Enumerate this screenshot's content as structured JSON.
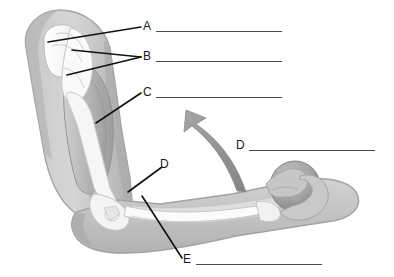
{
  "page": {
    "kind": "anatomy-labeling-worksheet",
    "background_color": "#ffffff",
    "width": 394,
    "height": 277
  },
  "illustration": {
    "name": "flexed-arm-holding-ball",
    "description": "Cutaway anatomical side view of a flexed human arm holding a ball, showing shoulder joint, humerus, biceps muscle, elbow joint, forearm bones and hand",
    "colors": {
      "skin_outline": "#b9b9b9",
      "skin_fill": "#cfcfcf",
      "skin_shadow": "#a8a8a8",
      "muscle": "#bdbdbd",
      "muscle_dark": "#9f9f9f",
      "bone": "#fbfbfb",
      "bone_shadow": "#dedede",
      "ball": "#a9a9a9",
      "ball_shadow": "#8e8e8e",
      "arrow": "#9a9a9a",
      "leader_line": "#111111",
      "answer_line": "#4a4a4a"
    },
    "motion_arrow": {
      "name": "curved-motion-arrow",
      "direction": "up-left"
    }
  },
  "labels": [
    {
      "id": "a",
      "text": "A",
      "x": 143,
      "y": 20,
      "line": {
        "x": 156,
        "y": 31,
        "width": 126
      }
    },
    {
      "id": "b",
      "text": "B",
      "x": 143,
      "y": 50,
      "line": {
        "x": 156,
        "y": 61,
        "width": 126
      }
    },
    {
      "id": "c",
      "text": "C",
      "x": 143,
      "y": 86,
      "line": {
        "x": 156,
        "y": 97,
        "width": 126
      }
    },
    {
      "id": "d_right",
      "text": "D",
      "x": 236,
      "y": 139,
      "line": {
        "x": 249,
        "y": 150,
        "width": 126
      }
    },
    {
      "id": "d_mid",
      "text": "D",
      "x": 160,
      "y": 158,
      "line": null
    },
    {
      "id": "e",
      "text": "E",
      "x": 183,
      "y": 253,
      "line": {
        "x": 196,
        "y": 264,
        "width": 126
      }
    }
  ],
  "leader_lines": [
    {
      "name": "leader-a",
      "from": [
        141,
        27
      ],
      "to": [
        48,
        42
      ]
    },
    {
      "name": "leader-b1",
      "from": [
        141,
        57
      ],
      "to": [
        72,
        50
      ]
    },
    {
      "name": "leader-b2",
      "from": [
        141,
        57
      ],
      "to": [
        67,
        75
      ]
    },
    {
      "name": "leader-c",
      "from": [
        141,
        93
      ],
      "to": [
        96,
        123
      ]
    },
    {
      "name": "leader-d",
      "from": [
        162,
        167
      ],
      "to": [
        128,
        192
      ]
    },
    {
      "name": "leader-e",
      "from": [
        182,
        258
      ],
      "to": [
        142,
        196
      ]
    }
  ]
}
